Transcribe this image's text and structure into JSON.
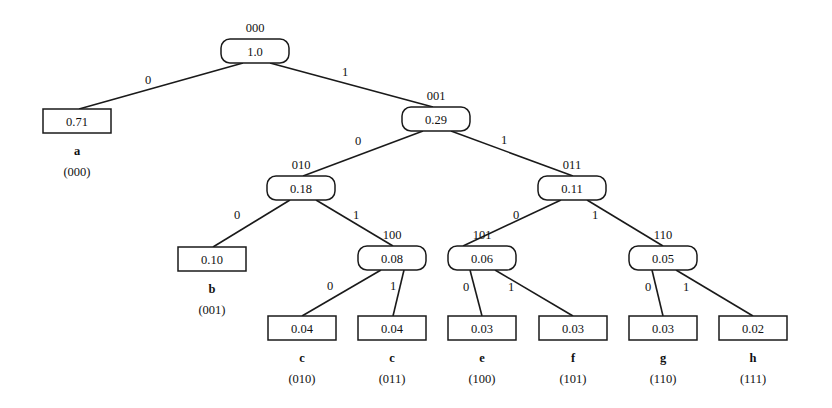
{
  "diagram": {
    "type": "binary-tree",
    "colors": {
      "stroke": "#1a1a1a",
      "text": "#111111",
      "background": "#ffffff"
    },
    "internal_nodes": [
      {
        "id": "n000",
        "value": "1.0",
        "code": "000"
      },
      {
        "id": "n001",
        "value": "0.29",
        "code": "001"
      },
      {
        "id": "n010",
        "value": "0.18",
        "code": "010"
      },
      {
        "id": "n011",
        "value": "0.11",
        "code": "011"
      },
      {
        "id": "n100",
        "value": "0.08",
        "code": "100"
      },
      {
        "id": "n101",
        "value": "0.06",
        "code": "101"
      },
      {
        "id": "n110",
        "value": "0.05",
        "code": "110"
      }
    ],
    "leaves": [
      {
        "id": "la",
        "value": "0.71",
        "symbol": "a",
        "code": "(000)"
      },
      {
        "id": "lb",
        "value": "0.10",
        "symbol": "b",
        "code": "(001)"
      },
      {
        "id": "lc1",
        "value": "0.04",
        "symbol": "c",
        "code": "(010)"
      },
      {
        "id": "lc2",
        "value": "0.04",
        "symbol": "c",
        "code": "(011)"
      },
      {
        "id": "le",
        "value": "0.03",
        "symbol": "e",
        "code": "(100)"
      },
      {
        "id": "lf",
        "value": "0.03",
        "symbol": "f",
        "code": "(101)"
      },
      {
        "id": "lg",
        "value": "0.03",
        "symbol": "g",
        "code": "(110)"
      },
      {
        "id": "lh",
        "value": "0.02",
        "symbol": "h",
        "code": "(111)"
      }
    ],
    "edges": [
      {
        "from": "n000",
        "to": "la",
        "label": "0"
      },
      {
        "from": "n000",
        "to": "n001",
        "label": "1"
      },
      {
        "from": "n001",
        "to": "n010",
        "label": "0"
      },
      {
        "from": "n001",
        "to": "n011",
        "label": "1"
      },
      {
        "from": "n010",
        "to": "lb",
        "label": "0"
      },
      {
        "from": "n010",
        "to": "n100",
        "label": "1"
      },
      {
        "from": "n011",
        "to": "n101",
        "label": "0"
      },
      {
        "from": "n011",
        "to": "n110",
        "label": "1"
      },
      {
        "from": "n100",
        "to": "lc1",
        "label": "0"
      },
      {
        "from": "n100",
        "to": "lc2",
        "label": "1"
      },
      {
        "from": "n101",
        "to": "le",
        "label": "0"
      },
      {
        "from": "n101",
        "to": "lf",
        "label": "1"
      },
      {
        "from": "n110",
        "to": "lg",
        "label": "0"
      },
      {
        "from": "n110",
        "to": "lh",
        "label": "1"
      }
    ]
  }
}
